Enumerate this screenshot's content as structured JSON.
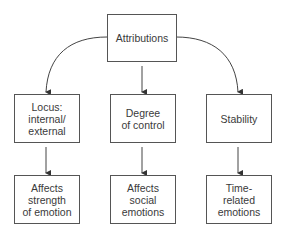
{
  "diagram": {
    "root": {
      "label": "Attributions"
    },
    "categories": [
      {
        "label": "Locus:\ninternal/\nexternal",
        "effect": "Affects\nstrength\nof emotion"
      },
      {
        "label": "Degree\nof control",
        "effect": "Affects\nsocial\nemotions"
      },
      {
        "label": "Stability",
        "effect": "Time-\nrelated\nemotions"
      }
    ]
  }
}
